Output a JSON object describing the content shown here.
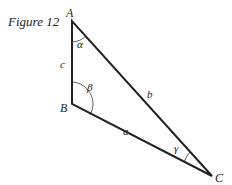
{
  "figure_title": "Figure 12",
  "vertices": {
    "A": "A",
    "B": "B",
    "C": "C"
  },
  "sides": {
    "a": "a",
    "b": "b",
    "c": "c"
  },
  "angles": {
    "alpha": "α",
    "beta": "β",
    "gamma": "γ"
  },
  "colors": {
    "line": "#222222",
    "background": "#ffffff"
  }
}
